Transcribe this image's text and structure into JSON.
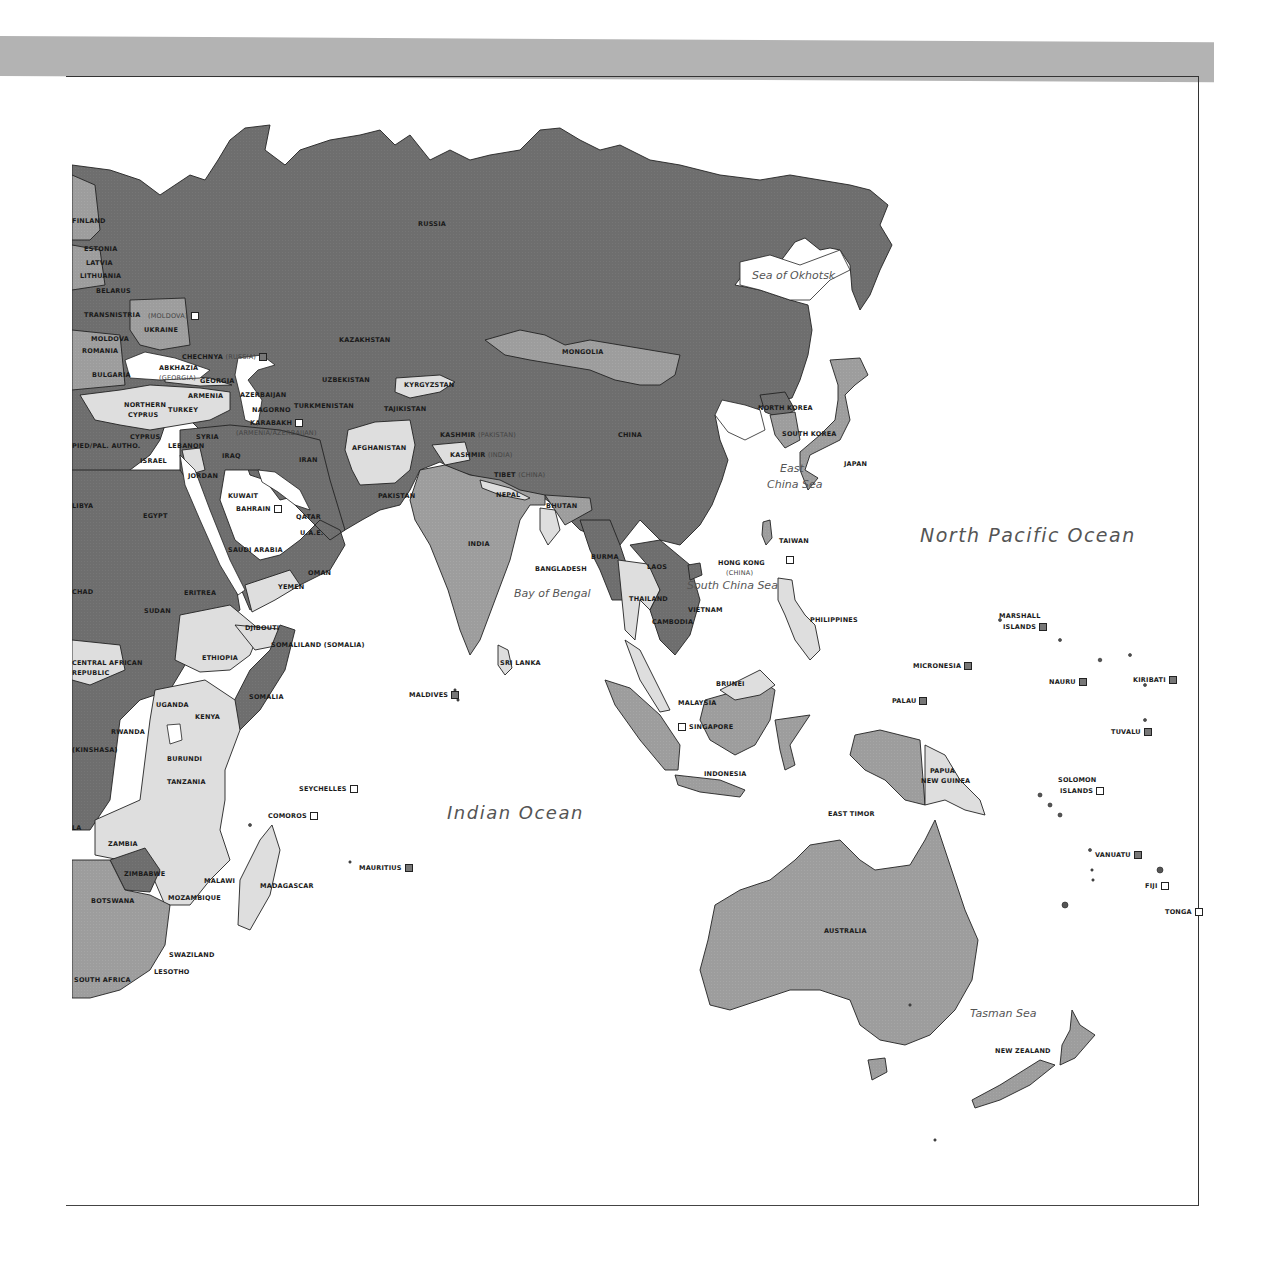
{
  "colors": {
    "band": "#b3b3b3",
    "dark_region": "#6e6e6e",
    "mid_region": "#9d9d9d",
    "light_region": "#dedede",
    "water": "#ffffff",
    "border": "#222222"
  },
  "map": {
    "title": "",
    "oceans": {
      "north_pacific": "North Pacific Ocean",
      "indian": "Indian Ocean",
      "sea_okhotsk": "Sea of Okhotsk",
      "east_china_1": "East",
      "east_china_2": "China Sea",
      "south_china": "South China Sea",
      "bay_bengal": "Bay of Bengal",
      "tasman": "Tasman Sea"
    },
    "countries": {
      "russia": "RUSSIA",
      "finland": "FINLAND",
      "estonia": "ESTONIA",
      "latvia": "LATVIA",
      "lithuania": "LITHUANIA",
      "belarus": "BELARUS",
      "transnistria": "TRANSNISTRIA",
      "moldova_sub": "(MOLDOVA)",
      "ukraine": "UKRAINE",
      "moldova": "MOLDOVA",
      "romania": "ROMANIA",
      "bulgaria": "BULGARIA",
      "greece": "GREECE",
      "chechnya": "CHECHNYA",
      "chechnya_sub": "(RUSSIA)",
      "abkhazia": "ABKHAZIA",
      "abkhazia_sub": "(GEORGIA)",
      "georgia": "GEORGIA",
      "armenia": "ARMENIA",
      "azerbaijan": "AZERBAIJAN",
      "nagorno_1": "NAGORNO",
      "nagorno_2": "KARABAKH",
      "nagorno_sub": "(ARMENIA/AZERBAIJAN)",
      "northern_cyprus_1": "NORTHERN",
      "northern_cyprus_2": "CYPRUS",
      "turkey": "TURKEY",
      "cyprus": "CYPRUS",
      "lebanon": "LEBANON",
      "pal_autho": "PIED/PAL. AUTHO.",
      "israel": "ISRAEL",
      "syria": "SYRIA",
      "iraq": "IRAQ",
      "iran": "IRAN",
      "jordan": "JORDAN",
      "kuwait": "KUWAIT",
      "bahrain": "BAHRAIN",
      "qatar": "QATAR",
      "uae": "U.A.E.",
      "saudi_arabia": "SAUDI ARABIA",
      "oman": "OMAN",
      "yemen": "YEMEN",
      "kazakhstan": "KAZAKHSTAN",
      "uzbekistan": "UZBEKISTAN",
      "turkmenistan": "TURKMENISTAN",
      "kyrgyzstan": "KYRGYZSTAN",
      "tajikistan": "TAJIKISTAN",
      "afghanistan": "AFGHANISTAN",
      "pakistan": "PAKISTAN",
      "kashmir_pk": "KASHMIR",
      "kashmir_pk_sub": "(PAKISTAN)",
      "kashmir_in": "KASHMIR",
      "kashmir_in_sub": "(INDIA)",
      "tibet": "TIBET",
      "tibet_sub": "(CHINA)",
      "mongolia": "MONGOLIA",
      "china": "CHINA",
      "nepal": "NEPAL",
      "bhutan": "BHUTAN",
      "india": "INDIA",
      "bangladesh": "BANGLADESH",
      "burma": "BURMA",
      "laos": "LAOS",
      "thailand": "THAILAND",
      "vietnam": "VIETNAM",
      "cambodia": "CAMBODIA",
      "sri_lanka": "SRI LANKA",
      "maldives": "MALDIVES",
      "north_korea": "NORTH KOREA",
      "south_korea": "SOUTH KOREA",
      "japan": "JAPAN",
      "taiwan": "TAIWAN",
      "hong_kong": "HONG KONG",
      "hong_kong_sub": "(CHINA)",
      "philippines": "PHILIPPINES",
      "malaysia": "MALAYSIA",
      "brunei": "BRUNEI",
      "singapore": "SINGAPORE",
      "indonesia": "INDONESIA",
      "east_timor": "EAST TIMOR",
      "papua_1": "PAPUA",
      "papua_2": "NEW GUINEA",
      "australia": "AUSTRALIA",
      "new_zealand": "NEW ZEALAND",
      "egypt": "EGYPT",
      "libya": "LIBYA",
      "chad": "CHAD",
      "sudan": "SUDAN",
      "eritrea": "ERITREA",
      "djibouti": "DJIBOUTI",
      "somaliland": "SOMALILAND (SOMALIA)",
      "ethiopia": "ETHIOPIA",
      "car_1": "CENTRAL AFRICAN",
      "car_2": "REPUBLIC",
      "somalia": "SOMALIA",
      "uganda": "UGANDA",
      "kenya": "KENYA",
      "rwanda": "RWANDA",
      "drc": "(KINSHASA)",
      "burundi": "BURUNDI",
      "tanzania": "TANZANIA",
      "angola": "LA",
      "zambia": "ZAMBIA",
      "malawi": "MALAWI",
      "zimbabwe": "ZIMBABWE",
      "mozambique": "MOZAMBIQUE",
      "botswana": "BOTSWANA",
      "madagascar": "MADAGASCAR",
      "swaziland": "SWAZILAND",
      "lesotho": "LESOTHO",
      "south_africa": "SOUTH AFRICA",
      "seychelles": "SEYCHELLES",
      "comoros": "COMOROS",
      "mauritius": "MAURITIUS",
      "marshall_1": "MARSHALL",
      "marshall_2": "ISLANDS",
      "micronesia": "MICRONESIA",
      "nauru": "NAURU",
      "kiribati": "KIRIBATI",
      "palau": "PALAU",
      "tuvalu": "TUVALU",
      "solomon_1": "SOLOMON",
      "solomon_2": "ISLANDS",
      "vanuatu": "VANUATU",
      "fiji": "FIJI",
      "tonga": "TONGA"
    }
  }
}
